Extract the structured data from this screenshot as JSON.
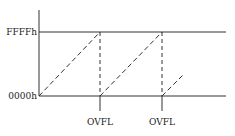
{
  "diagram": {
    "y_labels": {
      "max": "FFFFh",
      "min": "0000h"
    },
    "events": [
      {
        "label": "OVFL",
        "x": 100
      },
      {
        "label": "OVFL",
        "x": 162
      }
    ],
    "colors": {
      "line": "#333333",
      "background": "#ffffff"
    }
  }
}
